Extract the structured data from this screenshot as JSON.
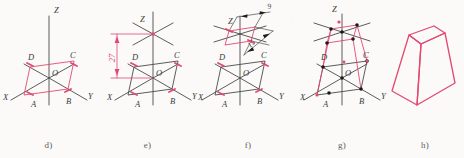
{
  "figure": {
    "background_color": "#fbfaf9",
    "axis_color": "#4a4a4a",
    "accent_color": "#e2496f",
    "accent_color_light": "#ea7f9b",
    "vertex_dot_color": "#1a1a1a",
    "caption_color": "#5d5d5d"
  },
  "panels": [
    {
      "id": "d",
      "caption": "d)",
      "description": "isometric axes with base parallelogram ABCD",
      "axis_labels": {
        "z": "Z",
        "x": "X",
        "y": "Y"
      },
      "point_labels": {
        "origin": "O",
        "a": "A",
        "b": "B",
        "c": "C",
        "d": "D"
      }
    },
    {
      "id": "e",
      "caption": "e)",
      "description": "apex height laid off on Z axis with dimension",
      "axis_labels": {
        "z": "Z",
        "x": "X",
        "y": "Y"
      },
      "point_labels": {
        "origin": "O",
        "a": "A",
        "b": "B",
        "c": "C",
        "d": "D"
      },
      "dimension": {
        "value": "27",
        "orientation": "vertical"
      }
    },
    {
      "id": "f",
      "caption": "f)",
      "description": "top face parallelogram constructed at apex height",
      "axis_labels": {
        "z": "Z",
        "x": "X",
        "y": "Y"
      },
      "point_labels": {
        "origin": "O",
        "a": "A",
        "b": "B",
        "c": "C",
        "d": "D"
      },
      "dimensions": [
        {
          "value": "9",
          "orientation": "upper"
        },
        {
          "value": "15",
          "orientation": "lower"
        }
      ]
    },
    {
      "id": "g",
      "caption": "g)",
      "description": "lateral edges joining base and top face vertices",
      "axis_labels": {
        "z": "Z",
        "x": "X",
        "y": "Y"
      },
      "point_labels": {
        "origin": "O",
        "a": "A",
        "b": "B",
        "c": "C",
        "d": "D"
      }
    },
    {
      "id": "h",
      "caption": "h)",
      "description": "completed frustum outline with construction lines removed"
    }
  ]
}
